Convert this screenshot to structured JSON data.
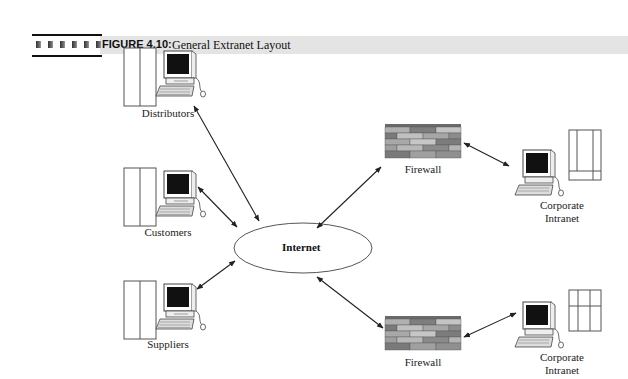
{
  "figure": {
    "label": "FIGURE 4.10:",
    "title": "General Extranet Layout",
    "header_squares": 6
  },
  "nodes": {
    "distributors": {
      "label": "Distributors",
      "icon": "computer-with-server-icon"
    },
    "customers": {
      "label": "Customers",
      "icon": "computer-with-server-icon"
    },
    "suppliers": {
      "label": "Suppliers",
      "icon": "computer-with-server-icon"
    },
    "internet": {
      "label": "Internet",
      "shape": "ellipse"
    },
    "firewall_top": {
      "label": "Firewall",
      "icon": "brick-wall-icon"
    },
    "firewall_bottom": {
      "label": "Firewall",
      "icon": "brick-wall-icon"
    },
    "intranet_top": {
      "label_line1": "Corporate",
      "label_line2": "Intranet",
      "icon": "computer-with-server-icon"
    },
    "intranet_bottom": {
      "label_line1": "Corporate",
      "label_line2": "Intranet",
      "icon": "computer-with-server-icon"
    }
  },
  "edges": [
    {
      "from": "distributors",
      "to": "internet",
      "type": "bidirectional"
    },
    {
      "from": "customers",
      "to": "internet",
      "type": "bidirectional"
    },
    {
      "from": "suppliers",
      "to": "internet",
      "type": "bidirectional"
    },
    {
      "from": "internet",
      "to": "firewall_top",
      "type": "bidirectional"
    },
    {
      "from": "internet",
      "to": "firewall_bottom",
      "type": "bidirectional"
    },
    {
      "from": "firewall_top",
      "to": "intranet_top",
      "type": "bidirectional"
    },
    {
      "from": "firewall_bottom",
      "to": "intranet_bottom",
      "type": "bidirectional"
    }
  ],
  "colors": {
    "header_band": "#e4e4e4",
    "line": "#222222",
    "screen": "#111111",
    "brick_light": "#b8b8b8",
    "brick_mid": "#9a9a9a",
    "brick_dark": "#7a7a7a"
  }
}
